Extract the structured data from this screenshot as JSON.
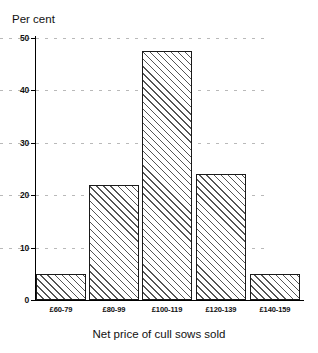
{
  "figure": {
    "y_axis_title": "Per cent",
    "x_axis_title": "Net price of cull sows sold",
    "top_caption_fragment": "",
    "bottom_caption_fragment": ""
  },
  "chart_data": {
    "type": "bar",
    "title": "",
    "subtitle": "",
    "xlabel": "Net price of cull sows sold",
    "ylabel": "Per cent",
    "categories": [
      "£60-79",
      "£80-99",
      "£100-119",
      "£120-139",
      "£140-159"
    ],
    "values": [
      5,
      22,
      47.5,
      24,
      5
    ],
    "ylim": [
      0,
      50
    ],
    "yticks": [
      0,
      10,
      20,
      30,
      40,
      50
    ],
    "ytick_labels": [
      "0",
      "10",
      "20",
      "30",
      "40",
      "50"
    ],
    "grid": "horizontal-dotted",
    "legend": "none",
    "bar_fill": "diagonal-hatch-45",
    "bar_edge_color": "#1a1a1a",
    "grid_color": "#b9b9b9",
    "axis_color": "#000000"
  }
}
